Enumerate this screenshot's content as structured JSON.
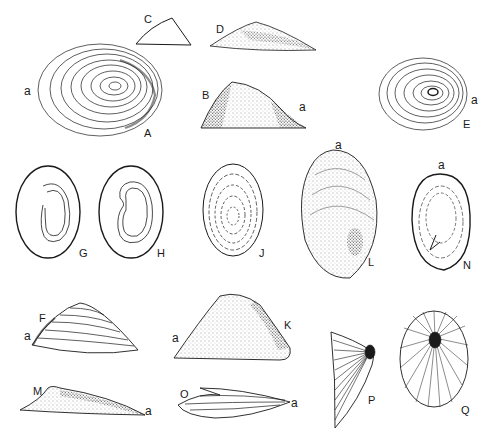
{
  "plate": {
    "background": "#ffffff",
    "ink": "#1a1a1a",
    "figures": [
      {
        "id": "A",
        "label": "A",
        "anterior": "a",
        "view": "dorsal",
        "shape": "oval-concentric"
      },
      {
        "id": "B",
        "label": "B",
        "anterior": "a",
        "view": "lateral",
        "shape": "cone-stippled"
      },
      {
        "id": "C",
        "label": "C",
        "view": "lateral-outline",
        "shape": "triangle-outline"
      },
      {
        "id": "D",
        "label": "D",
        "view": "lateral",
        "shape": "low-cone-stippled"
      },
      {
        "id": "E",
        "label": "E",
        "anterior": "a",
        "view": "dorsal",
        "shape": "oval-concentric"
      },
      {
        "id": "F",
        "label": "F",
        "anterior": "a",
        "view": "lateral",
        "shape": "cone-ribbed"
      },
      {
        "id": "G",
        "label": "G",
        "view": "ventral",
        "shape": "oval-muscle-scar-open"
      },
      {
        "id": "H",
        "label": "H",
        "view": "ventral",
        "shape": "oval-muscle-scar-kidney"
      },
      {
        "id": "J",
        "label": "J",
        "view": "dorsal",
        "shape": "oval-concentric-dashed"
      },
      {
        "id": "K",
        "label": "K",
        "anterior": "a",
        "view": "lateral",
        "shape": "tall-cone-stippled"
      },
      {
        "id": "L",
        "label": "L",
        "anterior": "a",
        "view": "dorsal",
        "shape": "egg-stippled"
      },
      {
        "id": "M",
        "label": "M",
        "anterior": "a",
        "view": "lateral",
        "shape": "flat-stippled"
      },
      {
        "id": "N",
        "label": "N",
        "anterior": "a",
        "view": "ventral",
        "shape": "oblong-dashed"
      },
      {
        "id": "O",
        "label": "O",
        "anterior": "a",
        "view": "lateral",
        "shape": "flat-ribbed"
      },
      {
        "id": "P",
        "label": "P",
        "view": "lateral",
        "shape": "fan-radial"
      },
      {
        "id": "Q",
        "label": "Q",
        "view": "dorsal",
        "shape": "oval-radial"
      }
    ]
  },
  "labels": {
    "A": "A",
    "B": "B",
    "C": "C",
    "D": "D",
    "E": "E",
    "F": "F",
    "G": "G",
    "H": "H",
    "J": "J",
    "K": "K",
    "L": "L",
    "M": "M",
    "N": "N",
    "O": "O",
    "P": "P",
    "Q": "Q",
    "anterior": "a"
  }
}
